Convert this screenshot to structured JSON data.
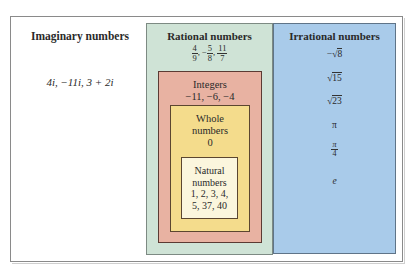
{
  "diagram": {
    "type": "nested-sets",
    "imaginary": {
      "title": "Imaginary numbers",
      "values": "4i, −11i, 3 + 2i"
    },
    "rational": {
      "title": "Rational numbers",
      "fractions": [
        {
          "sign": "",
          "num": "4",
          "den": "9"
        },
        {
          "sign": "−",
          "num": "5",
          "den": "8"
        },
        {
          "sign": "",
          "num": "11",
          "den": "7"
        }
      ],
      "color": "#cfe3d6"
    },
    "integers": {
      "title": "Integers",
      "values": "−11, −6, −4",
      "color": "#e8b2a2"
    },
    "whole": {
      "title_line1": "Whole",
      "title_line2": "numbers",
      "values": "0",
      "color": "#f4dc8c"
    },
    "natural": {
      "title_line1": "Natural",
      "title_line2": "numbers",
      "values_line1": "1, 2, 3, 4,",
      "values_line2": "5, 37, 40",
      "color": "#fbf6dd"
    },
    "irrational": {
      "title": "Irrational numbers",
      "items": {
        "neg_sqrt8_sign": "−",
        "neg_sqrt8_radical": "√",
        "neg_sqrt8_value": "8",
        "sqrt15_radical": "√",
        "sqrt15_value": "15",
        "sqrt23_radical": "√",
        "sqrt23_value": "23",
        "pi": "π",
        "pi_over_4_num": "π",
        "pi_over_4_den": "4",
        "e": "e"
      },
      "color": "#a9cbea"
    }
  }
}
